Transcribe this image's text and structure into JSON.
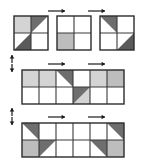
{
  "figure": {
    "background": "#ffffff"
  },
  "palette": {
    "white": "#ffffff",
    "light_gray": "#d4d4d4",
    "mid_gray": "#bdbdbd",
    "dark_gray": "#6e6e6e",
    "darker_gray": "#5a5a5a",
    "outline": "#2b2b2b",
    "grid_line": "#3a3a3a",
    "arrow": "#1a1a1a"
  },
  "geometry": {
    "cell": 17,
    "top_row_y": 16,
    "middle_row_y": 70,
    "bottom_row_y": 123,
    "top_blocks_x": [
      14,
      57,
      100
    ],
    "strip_x": 22
  },
  "arrows": {
    "top": [
      {
        "name": "arrow-top-left",
        "x": 48,
        "y": 11,
        "dir": "right",
        "length": 17
      },
      {
        "name": "arrow-top-right",
        "x": 88,
        "y": 11,
        "dir": "right",
        "length": 17
      }
    ],
    "middle": [
      {
        "name": "arrow-middle-left",
        "x": 48,
        "y": 64,
        "dir": "right",
        "length": 17
      },
      {
        "name": "arrow-middle-right",
        "x": 88,
        "y": 64,
        "dir": "right",
        "length": 17
      }
    ],
    "bottom": [
      {
        "name": "arrow-bottom-left",
        "x": 48,
        "y": 117,
        "dir": "right",
        "length": 17
      },
      {
        "name": "arrow-bottom-right",
        "x": 88,
        "y": 117,
        "dir": "right",
        "length": 17
      }
    ],
    "left": [
      {
        "name": "arrow-left-upper",
        "x": 12,
        "y": 55,
        "dir": "up",
        "length": 8
      },
      {
        "name": "arrow-left-lower",
        "x": 12,
        "y": 64,
        "dir": "down",
        "length": 8
      },
      {
        "name": "arrow-left-upper-2",
        "x": 12,
        "y": 108,
        "dir": "up",
        "length": 8
      },
      {
        "name": "arrow-left-lower-2",
        "x": 12,
        "y": 117,
        "dir": "down",
        "length": 8
      }
    ]
  },
  "blocks": {
    "top": [
      {
        "name": "block-top-1",
        "cols": 2,
        "rows": 2,
        "cells": [
          {
            "r": 0,
            "c": 0,
            "type": "solid",
            "fill": "light_gray"
          },
          {
            "r": 0,
            "c": 1,
            "type": "tri",
            "fill": "dark_gray",
            "bg": "white",
            "corner": "tl"
          },
          {
            "r": 1,
            "c": 0,
            "type": "tri",
            "fill": "darker_gray",
            "bg": "white",
            "corner": "br"
          },
          {
            "r": 1,
            "c": 1,
            "type": "solid",
            "fill": "white"
          }
        ]
      },
      {
        "name": "block-top-2",
        "cols": 2,
        "rows": 2,
        "cells": [
          {
            "r": 0,
            "c": 0,
            "type": "solid",
            "fill": "white"
          },
          {
            "r": 0,
            "c": 1,
            "type": "solid",
            "fill": "white"
          },
          {
            "r": 1,
            "c": 0,
            "type": "solid",
            "fill": "mid_gray"
          },
          {
            "r": 1,
            "c": 1,
            "type": "solid",
            "fill": "white"
          }
        ]
      },
      {
        "name": "block-top-3",
        "cols": 2,
        "rows": 2,
        "cells": [
          {
            "r": 0,
            "c": 0,
            "type": "tri",
            "fill": "dark_gray",
            "bg": "white",
            "corner": "tr"
          },
          {
            "r": 0,
            "c": 1,
            "type": "solid",
            "fill": "white"
          },
          {
            "r": 1,
            "c": 0,
            "type": "solid",
            "fill": "white"
          },
          {
            "r": 1,
            "c": 1,
            "type": "tri",
            "fill": "darker_gray",
            "bg": "white",
            "corner": "br"
          }
        ]
      }
    ],
    "middle": {
      "name": "block-middle-strip",
      "cols": 6,
      "rows": 2,
      "cells": [
        {
          "r": 0,
          "c": 0,
          "type": "solid",
          "fill": "light_gray"
        },
        {
          "r": 0,
          "c": 1,
          "type": "solid",
          "fill": "light_gray"
        },
        {
          "r": 0,
          "c": 2,
          "type": "tri",
          "fill": "dark_gray",
          "bg": "white",
          "corner": "tr"
        },
        {
          "r": 0,
          "c": 3,
          "type": "solid",
          "fill": "white"
        },
        {
          "r": 0,
          "c": 4,
          "type": "solid",
          "fill": "light_gray"
        },
        {
          "r": 0,
          "c": 5,
          "type": "solid",
          "fill": "mid_gray"
        },
        {
          "r": 1,
          "c": 0,
          "type": "solid",
          "fill": "white"
        },
        {
          "r": 1,
          "c": 1,
          "type": "solid",
          "fill": "white"
        },
        {
          "r": 1,
          "c": 2,
          "type": "solid",
          "fill": "white"
        },
        {
          "r": 1,
          "c": 3,
          "type": "tri",
          "fill": "dark_gray",
          "bg": "light_gray",
          "corner": "tl"
        },
        {
          "r": 1,
          "c": 4,
          "type": "solid",
          "fill": "white"
        },
        {
          "r": 1,
          "c": 5,
          "type": "solid",
          "fill": "white"
        }
      ]
    },
    "bottom": {
      "name": "block-bottom-strip",
      "cols": 6,
      "rows": 2,
      "cells": [
        {
          "r": 0,
          "c": 0,
          "type": "tri",
          "fill": "dark_gray",
          "bg": "white",
          "corner": "tr"
        },
        {
          "r": 0,
          "c": 1,
          "type": "solid",
          "fill": "white"
        },
        {
          "r": 0,
          "c": 2,
          "type": "solid",
          "fill": "white"
        },
        {
          "r": 0,
          "c": 3,
          "type": "solid",
          "fill": "white"
        },
        {
          "r": 0,
          "c": 4,
          "type": "solid",
          "fill": "white"
        },
        {
          "r": 0,
          "c": 5,
          "type": "tri",
          "fill": "dark_gray",
          "bg": "white",
          "corner": "tr"
        },
        {
          "r": 1,
          "c": 0,
          "type": "solid",
          "fill": "mid_gray"
        },
        {
          "r": 1,
          "c": 1,
          "type": "tri",
          "fill": "dark_gray",
          "bg": "white",
          "corner": "tl"
        },
        {
          "r": 1,
          "c": 2,
          "type": "solid",
          "fill": "white"
        },
        {
          "r": 1,
          "c": 3,
          "type": "solid",
          "fill": "white"
        },
        {
          "r": 1,
          "c": 4,
          "type": "tri",
          "fill": "dark_gray",
          "bg": "white",
          "corner": "tr"
        },
        {
          "r": 1,
          "c": 5,
          "type": "solid",
          "fill": "mid_gray"
        }
      ]
    }
  }
}
